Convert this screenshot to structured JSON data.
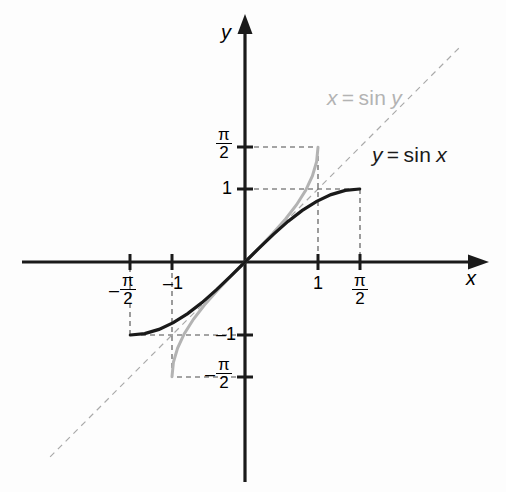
{
  "figure": {
    "kind": "function-graph",
    "background": "#fdfdfd"
  },
  "axes": {
    "x_axis_name": "x",
    "y_axis_name": "y",
    "origin_px": [
      245,
      262
    ],
    "unit_px": 73,
    "axis_color": "#1a1a1a"
  },
  "ticks": {
    "x": [
      {
        "label": "-π/2",
        "neg": "–",
        "num": "π",
        "den": "2",
        "value": -1.5708
      },
      {
        "label": "-1",
        "text": "–1",
        "value": -1
      },
      {
        "label": "1",
        "text": "1",
        "value": 1
      },
      {
        "label": "π/2",
        "num": "π",
        "den": "2",
        "value": 1.5708
      }
    ],
    "y": [
      {
        "label": "π/2",
        "num": "π",
        "den": "2",
        "value": 1.5708
      },
      {
        "label": "1",
        "text": "1",
        "value": 1
      },
      {
        "label": "-1",
        "text": "–1",
        "value": -1
      },
      {
        "label": "-π/2",
        "neg": "–",
        "num": "π",
        "den": "2",
        "value": -1.5708
      }
    ]
  },
  "curves": {
    "sine": {
      "label_lhs": "y",
      "label_eq": "=",
      "label_fn": "sin",
      "label_arg": "x",
      "label_full": "y = sin x",
      "color": "#1a1a1a",
      "width": 3.2,
      "domain": [
        -1.5708,
        1.5708
      ],
      "range": [
        -1,
        1
      ],
      "endpoints": [
        [
          -1.5708,
          -1
        ],
        [
          1.5708,
          1
        ]
      ]
    },
    "arcsine": {
      "label_lhs": "x",
      "label_eq": "=",
      "label_fn": "sin",
      "label_arg": "y",
      "label_full": "x = sin y",
      "color": "#b3b3b3",
      "width": 3.0,
      "domain": [
        -1,
        1
      ],
      "range": [
        -1.5708,
        1.5708
      ],
      "endpoints": [
        [
          -1,
          -1.5708
        ],
        [
          1,
          1.5708
        ]
      ]
    },
    "identity": {
      "label_full": "y = x",
      "color": "#aaaaaa",
      "width": 1.2,
      "dashed": true
    }
  },
  "guides": {
    "color": "#4d4d4d",
    "dash": "5,4",
    "width": 1.1,
    "segments": [
      {
        "note": "black curve endpoint (pi/2, 1) to y-axis"
      },
      {
        "note": "black curve endpoint (pi/2, 1) to x-axis"
      },
      {
        "note": "black curve endpoint (-pi/2, -1) to y-axis"
      },
      {
        "note": "black curve endpoint (-pi/2, -1) to x-axis"
      },
      {
        "note": "gray curve endpoint (1, pi/2) to y-axis"
      },
      {
        "note": "gray curve endpoint (1, pi/2) to x-axis"
      },
      {
        "note": "gray curve endpoint (-1, -pi/2) to y-axis"
      },
      {
        "note": "gray curve endpoint (-1, -pi/2) to x-axis"
      }
    ]
  },
  "chart_data": {
    "type": "line",
    "title": "",
    "xlabel": "x",
    "ylabel": "y",
    "xlim": [
      -2.9,
      3.4
    ],
    "ylim": [
      -3.0,
      3.2
    ],
    "grid": false,
    "legend": "inline-annotations",
    "x_tick_labels": [
      "-π/2",
      "-1",
      "1",
      "π/2"
    ],
    "x_tick_values": [
      -1.5708,
      -1,
      1,
      1.5708
    ],
    "y_tick_labels": [
      "π/2",
      "1",
      "-1",
      "-π/2"
    ],
    "y_tick_values": [
      1.5708,
      1,
      -1,
      -1.5708
    ],
    "series": [
      {
        "name": "y = sin x",
        "color": "#1a1a1a",
        "style": "solid",
        "x": [
          -1.5708,
          -1.3744,
          -1.178,
          -0.9817,
          -0.7854,
          -0.589,
          -0.3927,
          -0.1963,
          0,
          0.1963,
          0.3927,
          0.589,
          0.7854,
          0.9817,
          1.178,
          1.3744,
          1.5708
        ],
        "values": [
          -1,
          -0.9808,
          -0.9239,
          -0.8315,
          -0.7071,
          -0.5556,
          -0.3827,
          -0.1951,
          0,
          0.1951,
          0.3827,
          0.5556,
          0.7071,
          0.8315,
          0.9239,
          0.9808,
          1
        ]
      },
      {
        "name": "x = sin y",
        "color": "#b3b3b3",
        "style": "solid",
        "x": [
          -1,
          -0.9808,
          -0.9239,
          -0.8315,
          -0.7071,
          -0.5556,
          -0.3827,
          -0.1951,
          0,
          0.1951,
          0.3827,
          0.5556,
          0.7071,
          0.8315,
          0.9239,
          0.9808,
          1
        ],
        "values": [
          -1.5708,
          -1.3744,
          -1.178,
          -0.9817,
          -0.7854,
          -0.589,
          -0.3927,
          -0.1963,
          0,
          0.1963,
          0.3927,
          0.589,
          0.7854,
          0.9817,
          1.178,
          1.3744,
          1.5708
        ]
      },
      {
        "name": "y = x",
        "color": "#aaaaaa",
        "style": "dashed",
        "x": [
          -2.67,
          2.95
        ],
        "values": [
          -2.67,
          2.95
        ]
      }
    ],
    "annotations": [
      {
        "text": "y = sin x",
        "x": 1.75,
        "y": 1.28,
        "color": "#1a1a1a"
      },
      {
        "text": "x = sin y",
        "x": 1.25,
        "y": 2.35,
        "color": "#b3b3b3"
      }
    ]
  }
}
